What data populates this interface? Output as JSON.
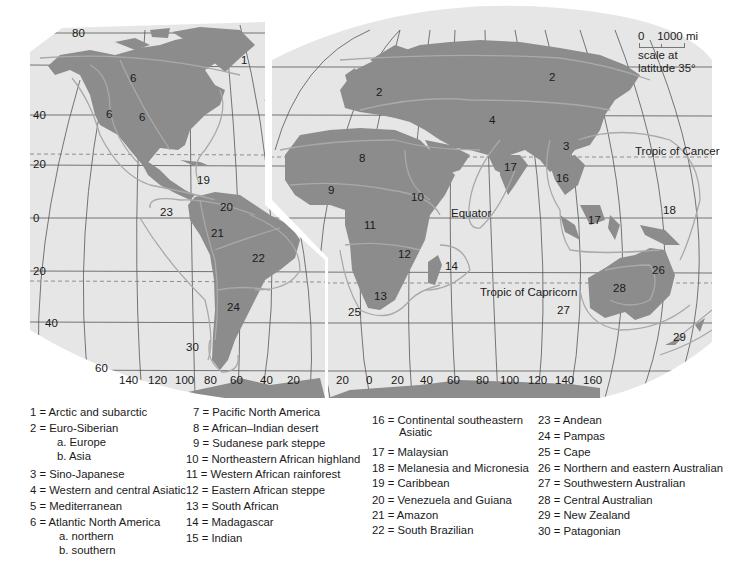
{
  "map": {
    "type": "interrupted world map of floristic regions",
    "colors": {
      "ocean": "#e6e6e6",
      "land": "#8c8c8c",
      "grid": "#555555",
      "boundary": "#a9a9a9",
      "background": "#ffffff"
    },
    "lines": {
      "tropic_of_cancer": "Tropic of Cancer",
      "equator": "Equator",
      "tropic_of_capricorn": "Tropic of Capricorn"
    },
    "latitude_labels": [
      "80",
      "40",
      "20",
      "0",
      "20",
      "40",
      "60"
    ],
    "longitude_labels_left": [
      "140",
      "120",
      "100",
      "80",
      "60",
      "40",
      "20"
    ],
    "longitude_labels_right": [
      "20",
      "0",
      "20",
      "40",
      "60",
      "80",
      "100",
      "120",
      "140",
      "160"
    ],
    "region_numbers": {
      "r1": "1",
      "r2a": "2",
      "r2b": "2",
      "r3": "3",
      "r4": "4",
      "r6a": "6",
      "r6b": "6",
      "r6c": "6",
      "r8": "8",
      "r9": "9",
      "r10": "10",
      "r11": "11",
      "r12": "12",
      "r13": "13",
      "r14": "14",
      "r16": "16",
      "r17a": "17",
      "r17b": "17",
      "r18": "18",
      "r19": "19",
      "r20": "20",
      "r21": "21",
      "r22": "22",
      "r23": "23",
      "r24": "24",
      "r25": "25",
      "r26": "26",
      "r27": "27",
      "r28": "28",
      "r29": "29",
      "r30": "30"
    },
    "scale": {
      "zero": "0",
      "distance": "1000 mi",
      "note_line1": "scale at",
      "note_line2": "latitude 35°"
    }
  },
  "legend": {
    "col1": [
      {
        "label": "1 = Arctic and subarctic"
      },
      {
        "label": "2 = Euro-Siberian",
        "subs": [
          "a. Europe",
          "b. Asia"
        ]
      },
      {
        "label": "3 = Sino-Japanese"
      },
      {
        "label": "4 = Western and central Asiatic"
      },
      {
        "label": "5 = Mediterranean"
      },
      {
        "label": "6 = Atlantic North America",
        "subs": [
          "a. northern",
          "b. southern"
        ]
      }
    ],
    "col2": [
      {
        "label": "7 = Pacific North America"
      },
      {
        "label": "8 = African–Indian desert"
      },
      {
        "label": "9 = Sudanese park steppe"
      },
      {
        "label": "10 = Northeastern African highland"
      },
      {
        "label": "11 = Western African rainforest"
      },
      {
        "label": "12 = Eastern African steppe"
      },
      {
        "label": "13 = South African"
      },
      {
        "label": "14 = Madagascar"
      },
      {
        "label": "15 = Indian"
      }
    ],
    "col3": [
      {
        "label": "16 = Continental southeastern",
        "cont": "Asiatic"
      },
      {
        "label": "17 = Malaysian"
      },
      {
        "label": "18 = Melanesia and Micronesia"
      },
      {
        "label": "19 = Caribbean"
      },
      {
        "label": "20 = Venezuela and Guiana"
      },
      {
        "label": "21 = Amazon"
      },
      {
        "label": "22 = South Brazilian"
      }
    ],
    "col4": [
      {
        "label": "23 = Andean"
      },
      {
        "label": "24 = Pampas"
      },
      {
        "label": "25 = Cape"
      },
      {
        "label": "26 = Northern and eastern Australian"
      },
      {
        "label": "27 = Southwestern Australian"
      },
      {
        "label": "28 = Central Australian"
      },
      {
        "label": "29 = New Zealand"
      },
      {
        "label": "30 = Patagonian"
      }
    ]
  }
}
